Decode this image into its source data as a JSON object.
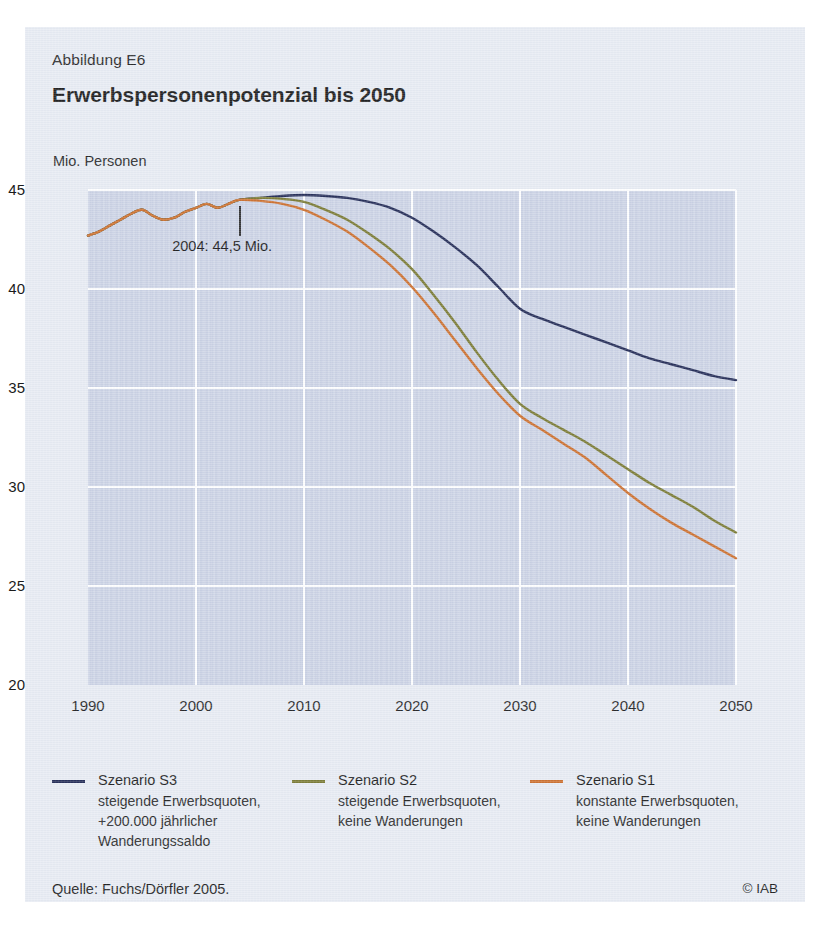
{
  "figure": {
    "label": "Abbildung E6",
    "title": "Erwerbspersonenpotenzial bis 2050",
    "source": "Quelle: Fuchs/Dörfler 2005.",
    "copyright": "© IAB"
  },
  "chart_data": {
    "type": "line",
    "title": "Erwerbspersonenpotenzial bis 2050",
    "xlabel": "",
    "ylabel": "Mio. Personen",
    "xlim": [
      1990,
      2050
    ],
    "ylim": [
      20,
      45
    ],
    "xticks": [
      1990,
      2000,
      2010,
      2020,
      2030,
      2040,
      2050
    ],
    "yticks": [
      20,
      25,
      30,
      35,
      40,
      45
    ],
    "grid": true,
    "legend_position": "below",
    "annotations": [
      {
        "text": "2004: 44,5 Mio.",
        "x": 2004,
        "y": 44.5
      }
    ],
    "series": [
      {
        "name": "Szenario S3",
        "description": "steigende Erwerbsquoten, +200.000 jährlicher Wanderungssaldo",
        "color": "#1c2450",
        "x": [
          1990,
          1991,
          1992,
          1993,
          1994,
          1995,
          1996,
          1997,
          1998,
          1999,
          2000,
          2001,
          2002,
          2003,
          2004,
          2006,
          2008,
          2010,
          2012,
          2014,
          2016,
          2018,
          2020,
          2022,
          2024,
          2026,
          2028,
          2030,
          2032,
          2034,
          2036,
          2038,
          2040,
          2042,
          2044,
          2046,
          2048,
          2050
        ],
        "values": [
          42.7,
          42.9,
          43.2,
          43.5,
          43.8,
          44.0,
          43.7,
          43.5,
          43.6,
          43.9,
          44.1,
          44.3,
          44.1,
          44.3,
          44.5,
          44.6,
          44.7,
          44.75,
          44.7,
          44.6,
          44.4,
          44.1,
          43.6,
          42.9,
          42.1,
          41.2,
          40.1,
          39.0,
          38.5,
          38.1,
          37.7,
          37.3,
          36.9,
          36.5,
          36.2,
          35.9,
          35.6,
          35.4
        ]
      },
      {
        "name": "Szenario S2",
        "description": "steigende Erwerbsquoten, keine Wanderungen",
        "color": "#76762c",
        "x": [
          1990,
          1991,
          1992,
          1993,
          1994,
          1995,
          1996,
          1997,
          1998,
          1999,
          2000,
          2001,
          2002,
          2003,
          2004,
          2006,
          2008,
          2010,
          2012,
          2014,
          2016,
          2018,
          2020,
          2022,
          2024,
          2026,
          2028,
          2030,
          2032,
          2034,
          2036,
          2038,
          2040,
          2042,
          2044,
          2046,
          2048,
          2050
        ],
        "values": [
          42.7,
          42.9,
          43.2,
          43.5,
          43.8,
          44.0,
          43.7,
          43.5,
          43.6,
          43.9,
          44.1,
          44.3,
          44.1,
          44.3,
          44.5,
          44.6,
          44.55,
          44.4,
          44.0,
          43.5,
          42.8,
          42.0,
          41.0,
          39.7,
          38.3,
          36.8,
          35.4,
          34.2,
          33.5,
          32.9,
          32.3,
          31.6,
          30.9,
          30.2,
          29.6,
          29.0,
          28.3,
          27.7
        ]
      },
      {
        "name": "Szenario S1",
        "description": "konstante Erwerbsquoten, keine Wanderungen",
        "color": "#cc6b26",
        "x": [
          1990,
          1991,
          1992,
          1993,
          1994,
          1995,
          1996,
          1997,
          1998,
          1999,
          2000,
          2001,
          2002,
          2003,
          2004,
          2006,
          2008,
          2010,
          2012,
          2014,
          2016,
          2018,
          2020,
          2022,
          2024,
          2026,
          2028,
          2030,
          2032,
          2034,
          2036,
          2038,
          2040,
          2042,
          2044,
          2046,
          2048,
          2050
        ],
        "values": [
          42.7,
          42.9,
          43.2,
          43.5,
          43.8,
          44.0,
          43.7,
          43.5,
          43.6,
          43.9,
          44.1,
          44.3,
          44.1,
          44.3,
          44.5,
          44.45,
          44.3,
          44.0,
          43.5,
          42.9,
          42.1,
          41.2,
          40.1,
          38.8,
          37.4,
          36.0,
          34.7,
          33.6,
          32.9,
          32.2,
          31.5,
          30.6,
          29.7,
          28.9,
          28.2,
          27.6,
          27.0,
          26.4
        ]
      }
    ]
  },
  "legend": [
    {
      "name": "Szenario S3",
      "line1": "steigende Erwerbsquoten,",
      "line2": "+200.000 jährlicher",
      "line3": "Wanderungssaldo",
      "color": "#1c2450"
    },
    {
      "name": "Szenario S2",
      "line1": "steigende Erwerbsquoten,",
      "line2": "keine Wanderungen",
      "line3": "",
      "color": "#76762c"
    },
    {
      "name": "Szenario S1",
      "line1": "konstante Erwerbsquoten,",
      "line2": "keine Wanderungen",
      "line3": "",
      "color": "#cc6b26"
    }
  ]
}
